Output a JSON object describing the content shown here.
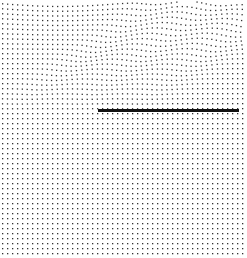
{
  "diagram": {
    "type": "deformed-lattice",
    "width": 247,
    "height": 258,
    "background": "#ffffff",
    "dot_color": "#333333",
    "dot_size": 1.3,
    "grid": {
      "spacing": 5,
      "x_start": 2,
      "y_start": 3,
      "columns": 49,
      "rows": 51
    },
    "waves": [
      {
        "label": "wave-front-1",
        "slope": 0.72,
        "offset": 10,
        "amplitude": 3.5
      },
      {
        "label": "wave-front-2",
        "slope": 0.72,
        "offset": 70,
        "amplitude": 3.5
      },
      {
        "label": "wave-front-3",
        "slope": 0.72,
        "offset": 130,
        "amplitude": 3.5
      }
    ],
    "wave_region_max_y": 110,
    "crack": {
      "x1": 98,
      "x2": 239,
      "y": 110,
      "thickness": 3,
      "color": "#111111"
    }
  }
}
